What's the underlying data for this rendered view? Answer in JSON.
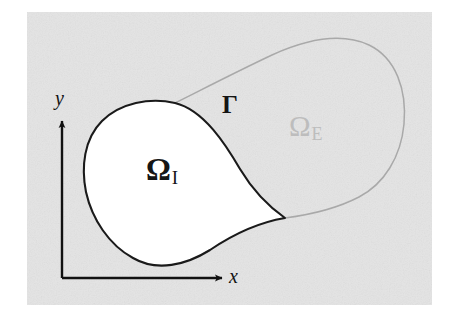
{
  "figure": {
    "type": "diagram",
    "background_color": "#ffffff",
    "panel_color": "#e4e4e4",
    "interior_fill_color": "#ffffff",
    "interior_stroke_color": "#1a1a1a",
    "exterior_stroke_color": "#a9a9a9",
    "axis_color": "#111111",
    "panel": {
      "x": 27,
      "y": 12,
      "width": 405,
      "height": 293
    },
    "labels": {
      "omega_interior": {
        "symbol": "Ω",
        "subscript": "I",
        "color": "#161616"
      },
      "omega_exterior": {
        "symbol": "Ω",
        "subscript": "E",
        "color": "#bdbdbd"
      },
      "boundary": {
        "symbol": "Γ",
        "color": "#141414"
      },
      "axis_x": {
        "symbol": "x",
        "color": "#131313"
      },
      "axis_y": {
        "symbol": "y",
        "color": "#131313"
      }
    },
    "axes": {
      "origin": {
        "x": 62,
        "y": 278
      },
      "x_tip": {
        "x": 224,
        "y": 278
      },
      "y_tip": {
        "x": 62,
        "y": 118
      }
    },
    "curves": {
      "interior_boundary": "M 175 103 C 150 98 120 104 102 122 C 84 140 81 168 86 192 C 92 219 110 245 134 258 C 158 271 186 264 209 249 C 239 230 262 222 285 218 C 268 205 252 188 240 168 C 226 144 204 109 175 103 Z",
      "exterior_boundary": "M 175 103 C 205 88 240 70 272 55 C 305 40 340 33 368 45 C 396 57 407 90 404 124 C 401 156 385 183 360 196 C 334 210 308 215 285 218 C 262 222 239 230 209 249 C 232 225 251 200 262 176 C 272 152 270 126 257 112"
    },
    "junction_points": [
      {
        "name": "upper-junction",
        "x": 175,
        "y": 103
      },
      {
        "name": "lower-cusp",
        "x": 285,
        "y": 218
      }
    ]
  }
}
